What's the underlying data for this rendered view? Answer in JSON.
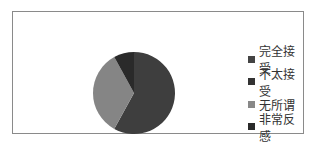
{
  "chart_data": {
    "type": "pie",
    "title": "",
    "categories": [
      "完全接受",
      "不太接受",
      "无所谓",
      "非常反感"
    ],
    "values": [
      58,
      0,
      34,
      8
    ],
    "unit": "%",
    "colors": [
      "#3e3e3e",
      "#333333",
      "#858585",
      "#2a2a2a"
    ],
    "legend_position": "right",
    "start_angle_deg": 0,
    "direction": "clockwise"
  },
  "legend": {
    "items": [
      {
        "label": "完全接受",
        "color": "#444444"
      },
      {
        "label": "不太接受",
        "color": "#333333"
      },
      {
        "label": "无所谓",
        "color": "#888888"
      },
      {
        "label": "非常反感",
        "color": "#2a2a2a"
      }
    ]
  }
}
